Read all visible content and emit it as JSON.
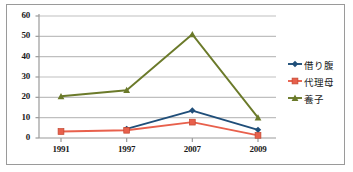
{
  "chart_data": {
    "type": "line",
    "title": "",
    "xlabel": "",
    "ylabel": "",
    "categories": [
      "1991",
      "1997",
      "2007",
      "2009"
    ],
    "ylim": [
      0,
      60
    ],
    "ytick_values": [
      0,
      10,
      20,
      30,
      40,
      50,
      60
    ],
    "ytick_labels": [
      "0",
      "10",
      "20",
      "30",
      "40",
      "50",
      "60"
    ],
    "grid": true,
    "grid_axis": "y",
    "legend_position": "right",
    "series": [
      {
        "name": "借り腹",
        "color": "#1f4e79",
        "marker": "diamond",
        "values": [
          null,
          4.5,
          13.5,
          4.0
        ]
      },
      {
        "name": "代理母",
        "color": "#e8604c",
        "marker": "square",
        "values": [
          3.2,
          3.8,
          7.8,
          1.3
        ]
      },
      {
        "name": "養子",
        "color": "#6b7a2a",
        "marker": "triangle",
        "values": [
          20.5,
          23.5,
          51.0,
          10.0
        ]
      }
    ]
  },
  "colors": {
    "border": "#9a9a9a",
    "grid": "#bfbfbf",
    "axis": "#9a9a9a",
    "text": "#1a1a1a",
    "background": "#ffffff"
  }
}
